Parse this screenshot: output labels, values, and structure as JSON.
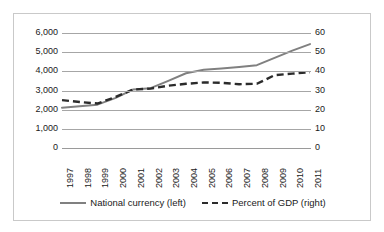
{
  "chart_data": {
    "type": "line",
    "title": "",
    "xlabel": "",
    "ylabel": "",
    "grid": true,
    "legend_position": "bottom",
    "categories": [
      "1997",
      "1998",
      "1999",
      "2000",
      "2001",
      "2002",
      "2003",
      "2004",
      "2005",
      "2006",
      "2007",
      "2008",
      "2009",
      "2010",
      "2011"
    ],
    "axes": {
      "left": {
        "label": "National currency",
        "ylim": [
          0,
          6000
        ],
        "ticks": [
          0,
          1000,
          2000,
          3000,
          4000,
          5000,
          6000
        ],
        "tick_labels": [
          "0",
          "1,000",
          "2,000",
          "3,000",
          "4,000",
          "5,000",
          "6,000"
        ]
      },
      "right": {
        "label": "Percent of GDP",
        "ylim": [
          0,
          60
        ],
        "ticks": [
          0,
          10,
          20,
          30,
          40,
          50,
          60
        ],
        "tick_labels": [
          "0",
          "10",
          "20",
          "30",
          "40",
          "50",
          "60"
        ]
      }
    },
    "series": [
      {
        "name": "National currency (left)",
        "axis": "left",
        "style": "solid",
        "color": "#808080",
        "values": [
          2100,
          2180,
          2260,
          2600,
          3050,
          3120,
          3500,
          3900,
          4080,
          4150,
          4230,
          4320,
          4700,
          5080,
          5420
        ]
      },
      {
        "name": "Percent of GDP (right)",
        "axis": "right",
        "style": "dashed",
        "color": "#2b2b2b",
        "values": [
          25.0,
          24.0,
          23.2,
          26.5,
          30.5,
          31.0,
          32.5,
          33.5,
          34.2,
          34.0,
          33.3,
          33.5,
          38.0,
          38.8,
          39.5
        ]
      }
    ]
  },
  "legend": {
    "entries": [
      {
        "label": "National currency (left)",
        "style": "solid"
      },
      {
        "label": "Percent of GDP (right)",
        "style": "dashed"
      }
    ]
  }
}
